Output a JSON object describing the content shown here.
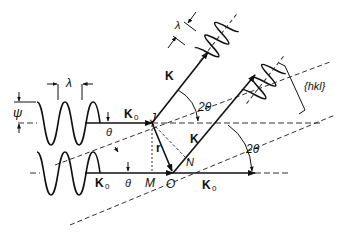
{
  "diagram": {
    "labels": {
      "lambda_left": "λ",
      "lambda_right": "λ",
      "psi": "ψ",
      "k0_upper": "K",
      "k0_upper_sub": "0",
      "k0_lower": "K",
      "k0_lower_sub": "0",
      "k0_right": "K",
      "k0_right_sub": "0",
      "k_upper": "K",
      "k_lower": "K",
      "theta_upper": "θ",
      "theta_lower": "θ",
      "two_theta_upper": "2θ",
      "two_theta_lower": "2θ",
      "point_j": "J",
      "point_m": "M",
      "point_o": "O",
      "point_n": "N",
      "vector_r": "r",
      "planes": "{hkl}"
    },
    "colors": {
      "stroke": "#111111",
      "dash": "#333333"
    }
  }
}
